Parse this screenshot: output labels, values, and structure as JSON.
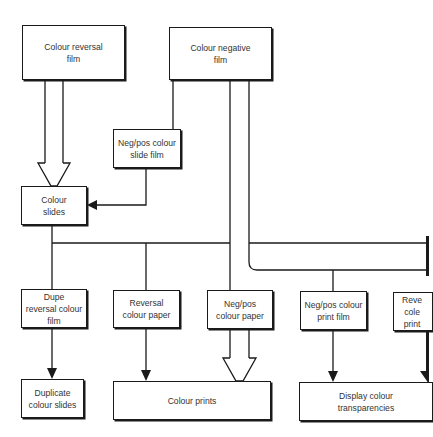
{
  "diagram": {
    "type": "flowchart",
    "nodes": {
      "colour_reversal_film": "Colour reversal\nfilm",
      "colour_negative_film": "Colour negative\nfilm",
      "negpos_colour_slide_film": "Neg/pos colour\nslide film",
      "colour_slides": "Colour\nslides",
      "dupe_reversal_colour_film": "Dupe\nreversal colour\nfilm",
      "reversal_colour_paper": "Reversal\ncolour paper",
      "negpos_colour_paper": "Neg/pos\ncolour paper",
      "negpos_colour_print_film": "Neg/pos colour\nprint film",
      "reversal_colour_print_film_cropped": "Reve\ncole\nprint",
      "duplicate_colour_slides": "Duplicate\ncolour slides",
      "colour_prints": "Colour prints",
      "display_colour_transparencies": "Display colour\ntransparencies"
    },
    "edges": [
      {
        "from": "colour_reversal_film",
        "to": "colour_slides",
        "style": "hollow-double-arrow"
      },
      {
        "from": "colour_negative_film",
        "to": "negpos_colour_slide_film",
        "style": "line"
      },
      {
        "from": "negpos_colour_slide_film",
        "to": "colour_slides",
        "style": "solid-arrow"
      },
      {
        "from": "colour_slides",
        "to": "dupe_reversal_colour_film",
        "style": "line"
      },
      {
        "from": "colour_slides",
        "to": "reversal_colour_paper",
        "style": "line"
      },
      {
        "from": "colour_slides",
        "to": "reversal_colour_print_film_cropped",
        "style": "line"
      },
      {
        "from": "colour_negative_film",
        "to": "negpos_colour_paper",
        "style": "hollow-double-arrow"
      },
      {
        "from": "colour_negative_film",
        "to": "negpos_colour_print_film",
        "style": "line"
      },
      {
        "from": "dupe_reversal_colour_film",
        "to": "duplicate_colour_slides",
        "style": "solid-arrow"
      },
      {
        "from": "reversal_colour_paper",
        "to": "colour_prints",
        "style": "solid-arrow"
      },
      {
        "from": "negpos_colour_paper",
        "to": "colour_prints",
        "style": "hollow-double-arrow"
      },
      {
        "from": "negpos_colour_print_film",
        "to": "display_colour_transparencies",
        "style": "solid-arrow"
      },
      {
        "from": "reversal_colour_print_film_cropped",
        "to": "display_colour_transparencies",
        "style": "solid-arrow"
      }
    ],
    "colors": {
      "line": "#1a1a1a",
      "text": "#333333",
      "background": "#ffffff"
    }
  }
}
